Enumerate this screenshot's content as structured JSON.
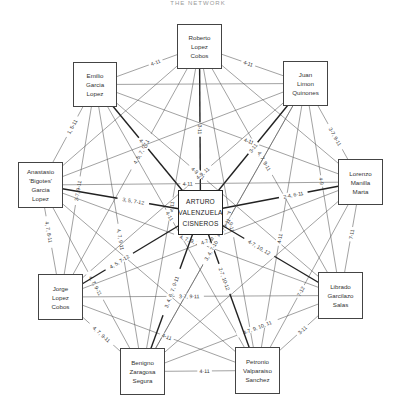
{
  "title": "THE NETWORK",
  "nodes": [
    {
      "id": "roberto",
      "lines": [
        "Roberto",
        "Lopez",
        "Cobos"
      ],
      "x": 177,
      "y": 24,
      "w": 45,
      "h": 45
    },
    {
      "id": "emilio",
      "lines": [
        "Emilio",
        "Garcia",
        "Lopez"
      ],
      "x": 73,
      "y": 62,
      "w": 44,
      "h": 45
    },
    {
      "id": "juan",
      "lines": [
        "Juan",
        "Limon",
        "Quinones"
      ],
      "x": 283,
      "y": 61,
      "w": 45,
      "h": 45
    },
    {
      "id": "anastasio",
      "lines": [
        "Anastasio",
        "'Bigotes'",
        "Garcia",
        "Lopez"
      ],
      "x": 18,
      "y": 162,
      "w": 45,
      "h": 46
    },
    {
      "id": "arturo",
      "lines": [
        "ARTURO",
        "VALENZUELA",
        "CISNEROS"
      ],
      "x": 178,
      "y": 190,
      "w": 45,
      "h": 45,
      "center": true
    },
    {
      "id": "lorenzo",
      "lines": [
        "Lorenzo",
        "Manilla",
        "Marta"
      ],
      "x": 338,
      "y": 159,
      "w": 45,
      "h": 46
    },
    {
      "id": "jorge",
      "lines": [
        "Jorge",
        "Lopez",
        "Cobos"
      ],
      "x": 38,
      "y": 274,
      "w": 45,
      "h": 46
    },
    {
      "id": "librado",
      "lines": [
        "Librado",
        "Garcilazo",
        "Salas"
      ],
      "x": 318,
      "y": 272,
      "w": 45,
      "h": 47
    },
    {
      "id": "benigno",
      "lines": [
        "Benigno",
        "Zaragosa",
        "Segura"
      ],
      "x": 120,
      "y": 348,
      "w": 45,
      "h": 47
    },
    {
      "id": "petronio",
      "lines": [
        "Petronio",
        "Valparaiso",
        "Sanchez"
      ],
      "x": 235,
      "y": 347,
      "w": 45,
      "h": 47
    }
  ],
  "edges": [
    {
      "a": "roberto",
      "b": "emilio",
      "label": "4-11"
    },
    {
      "a": "roberto",
      "b": "juan",
      "label": "4-11"
    },
    {
      "a": "roberto",
      "b": "arturo",
      "label": "3-11",
      "bold": true
    },
    {
      "a": "roberto",
      "b": "anastasio",
      "label": ""
    },
    {
      "a": "roberto",
      "b": "lorenzo",
      "label": ""
    },
    {
      "a": "roberto",
      "b": "jorge",
      "label": "4, 5, 7, 9-11"
    },
    {
      "a": "roberto",
      "b": "librado",
      "label": "4, 7, 9-11"
    },
    {
      "a": "roberto",
      "b": "benigno",
      "label": "4-9, 11"
    },
    {
      "a": "roberto",
      "b": "petronio",
      "label": "4, 7, 9-11"
    },
    {
      "a": "emilio",
      "b": "juan",
      "label": ""
    },
    {
      "a": "emilio",
      "b": "anastasio",
      "label": "1, 5-11"
    },
    {
      "a": "emilio",
      "b": "arturo",
      "label": "4-10",
      "bold": true
    },
    {
      "a": "emilio",
      "b": "jorge",
      "label": "3-7, 9-11"
    },
    {
      "a": "emilio",
      "b": "benigno",
      "label": "4, 7, 9-11"
    },
    {
      "a": "emilio",
      "b": "lorenzo",
      "label": "4-11"
    },
    {
      "a": "emilio",
      "b": "librado",
      "label": "4-9, 11"
    },
    {
      "a": "emilio",
      "b": "petronio",
      "label": "4-11"
    },
    {
      "a": "juan",
      "b": "arturo",
      "label": "3-11",
      "bold": true
    },
    {
      "a": "juan",
      "b": "lorenzo",
      "label": "3-7, 9-11"
    },
    {
      "a": "juan",
      "b": "anastasio",
      "label": ""
    },
    {
      "a": "juan",
      "b": "jorge",
      "label": "4-9, 11"
    },
    {
      "a": "juan",
      "b": "librado",
      "label": "4-9"
    },
    {
      "a": "juan",
      "b": "benigno",
      "label": "4-7, 9-11"
    },
    {
      "a": "juan",
      "b": "petronio",
      "label": "4-11"
    },
    {
      "a": "anastasio",
      "b": "arturo",
      "label": "3, 5, 7-12",
      "bold": true
    },
    {
      "a": "anastasio",
      "b": "jorge",
      "label": "4, 7, 8-11"
    },
    {
      "a": "anastasio",
      "b": "lorenzo",
      "label": "4-11"
    },
    {
      "a": "anastasio",
      "b": "librado",
      "label": "4, 7, 9, 11"
    },
    {
      "a": "anastasio",
      "b": "benigno",
      "label": "4, 7, 9-11"
    },
    {
      "a": "anastasio",
      "b": "petronio",
      "label": ""
    },
    {
      "a": "lorenzo",
      "b": "arturo",
      "label": "2-4, 6-11",
      "bold": true
    },
    {
      "a": "lorenzo",
      "b": "librado",
      "label": "7-11"
    },
    {
      "a": "lorenzo",
      "b": "jorge",
      "label": "4-7, 9-11"
    },
    {
      "a": "lorenzo",
      "b": "benigno",
      "label": ""
    },
    {
      "a": "lorenzo",
      "b": "petronio",
      "label": "7-12"
    },
    {
      "a": "jorge",
      "b": "arturo",
      "label": "4, 5, 7-12",
      "bold": true
    },
    {
      "a": "jorge",
      "b": "librado",
      "label": "3-7, 9-11"
    },
    {
      "a": "jorge",
      "b": "benigno",
      "label": "4, 7, 9-11"
    },
    {
      "a": "jorge",
      "b": "petronio",
      "label": "4-11"
    },
    {
      "a": "librado",
      "b": "arturo",
      "label": "4-7, 10, 12",
      "bold": true
    },
    {
      "a": "librado",
      "b": "benigno",
      "label": "4-7, 9, 10, 11"
    },
    {
      "a": "librado",
      "b": "petronio",
      "label": "3-11"
    },
    {
      "a": "benigno",
      "b": "arturo",
      "label": "3, 4, 6, 7, 9-11",
      "bold": true
    },
    {
      "a": "benigno",
      "b": "petronio",
      "label": "4-11"
    },
    {
      "a": "petronio",
      "b": "arturo",
      "label": "2-7, 10-12",
      "bold": true
    },
    {
      "a": "benigno",
      "b": "juan",
      "label": "3, 4, 7-10"
    }
  ]
}
